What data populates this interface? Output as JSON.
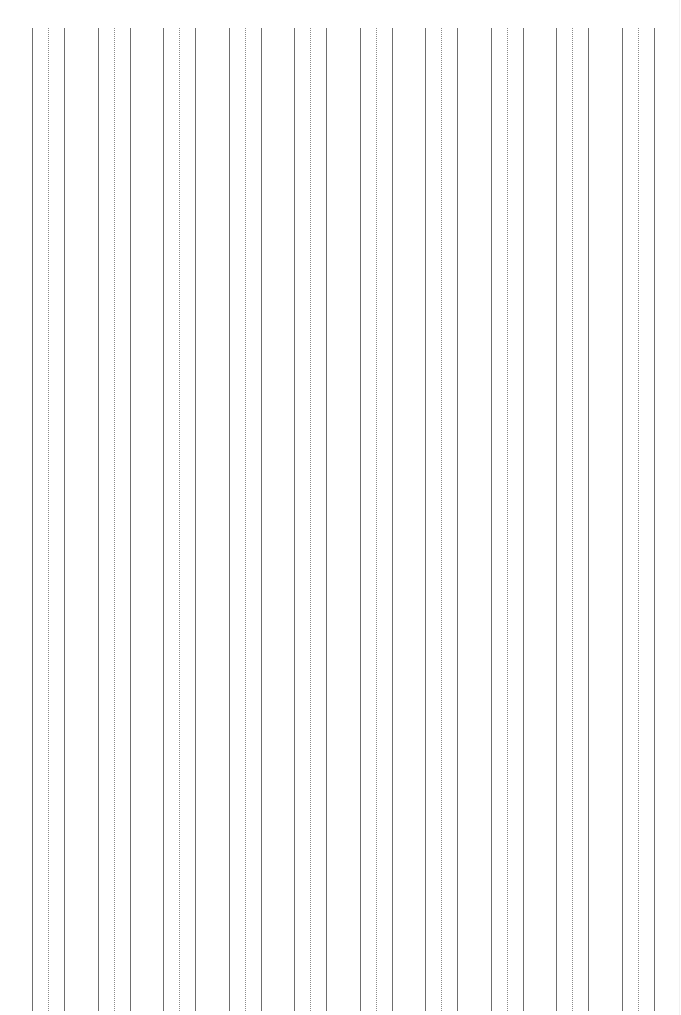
{
  "page": {
    "type": "vertical-lined handwriting practice sheet",
    "background": "#ffffff",
    "width": 681,
    "height": 1015
  },
  "layout": {
    "line_top": 28,
    "line_bottom": 1011,
    "group_count": 10,
    "first_group_x": 32,
    "group_pitch": 65.5,
    "group_pattern": [
      {
        "offset": 0,
        "style": "solid"
      },
      {
        "offset": 16,
        "style": "dotted"
      },
      {
        "offset": 32,
        "style": "solid"
      }
    ]
  },
  "colors": {
    "solid_line": "#6e6e6e",
    "dotted_line": "#8a8a8a"
  },
  "groups": [
    {
      "x": 32
    },
    {
      "x": 97.5
    },
    {
      "x": 163
    },
    {
      "x": 228.5
    },
    {
      "x": 294
    },
    {
      "x": 359.5
    },
    {
      "x": 425
    },
    {
      "x": 490.5
    },
    {
      "x": 556
    },
    {
      "x": 621.5
    }
  ]
}
